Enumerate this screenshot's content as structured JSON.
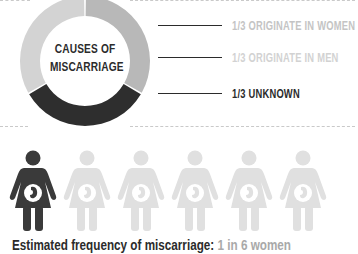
{
  "chart_data": {
    "type": "pie",
    "variant": "donut",
    "title": "CAUSES OF MISCARRIAGE",
    "categories": [
      "1/3 ORIGINATE IN WOMEN",
      "1/3 ORIGINATE IN MEN",
      "1/3 UNKNOWN"
    ],
    "values": [
      33.3,
      33.3,
      33.3
    ],
    "colors": [
      "#b5b5b5",
      "#d6d6d6",
      "#2e2e2e"
    ],
    "legend_position": "right"
  },
  "donut": {
    "center_line1": "CAUSES OF",
    "center_line2": "MISCARRIAGE"
  },
  "legend": [
    {
      "label": "1/3 ORIGINATE IN WOMEN",
      "color": "#c4c4c4"
    },
    {
      "label": "1/3 ORIGINATE IN MEN",
      "color": "#d2d2d2"
    },
    {
      "label": "1/3 UNKNOWN",
      "color": "#2b2b2b"
    }
  ],
  "pictogram": {
    "total": 6,
    "highlighted": 1,
    "highlight_color": "#3a3a3a",
    "muted_color": "#e0e0e0"
  },
  "caption": {
    "label": "Estimated frequency of miscarriage:",
    "value": "1 in 6 women"
  }
}
